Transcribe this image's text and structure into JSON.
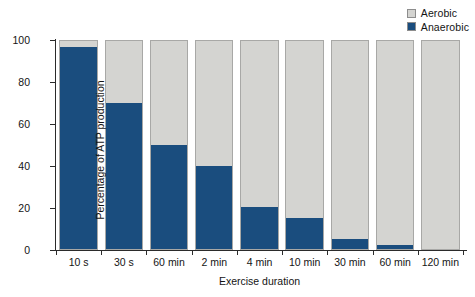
{
  "chart_data": {
    "type": "bar",
    "subtype": "stacked-100-percent",
    "title": "",
    "xlabel": "Exercise duration",
    "ylabel": "Percentage of ATP production",
    "ylim": [
      0,
      100
    ],
    "yticks": [
      0,
      20,
      40,
      60,
      80,
      100
    ],
    "grid": false,
    "legend_position": "top-right",
    "categories": [
      "10 s",
      "30 s",
      "60 min",
      "2 min",
      "4 min",
      "10 min",
      "30 min",
      "60 min",
      "120 min"
    ],
    "series": [
      {
        "name": "Aerobic",
        "color": "#d4d4d1",
        "values": [
          3,
          30,
          50,
          60,
          80,
          85,
          95,
          98,
          100
        ]
      },
      {
        "name": "Anaerobic",
        "color": "#1a4d7e",
        "values": [
          97,
          70,
          50,
          40,
          20,
          15,
          5,
          2,
          0
        ]
      }
    ]
  },
  "legend": {
    "items": [
      {
        "label": "Aerobic",
        "color": "#d4d4d1"
      },
      {
        "label": "Anaerobic",
        "color": "#1a4d7e"
      }
    ]
  },
  "axes": {
    "y_title": "Percentage of ATP production",
    "x_title": "Exercise duration",
    "y_tick_labels": [
      "0",
      "20",
      "40",
      "60",
      "80",
      "100"
    ],
    "x_tick_labels": [
      "10 s",
      "30 s",
      "60 min",
      "2 min",
      "4 min",
      "10 min",
      "30 min",
      "60 min",
      "120 min"
    ]
  },
  "colors": {
    "aerobic": "#d4d4d1",
    "anaerobic": "#1a4d7e",
    "axis": "#2b2b2b",
    "bar_outline": "#a8a8a6",
    "background": "#ffffff"
  }
}
